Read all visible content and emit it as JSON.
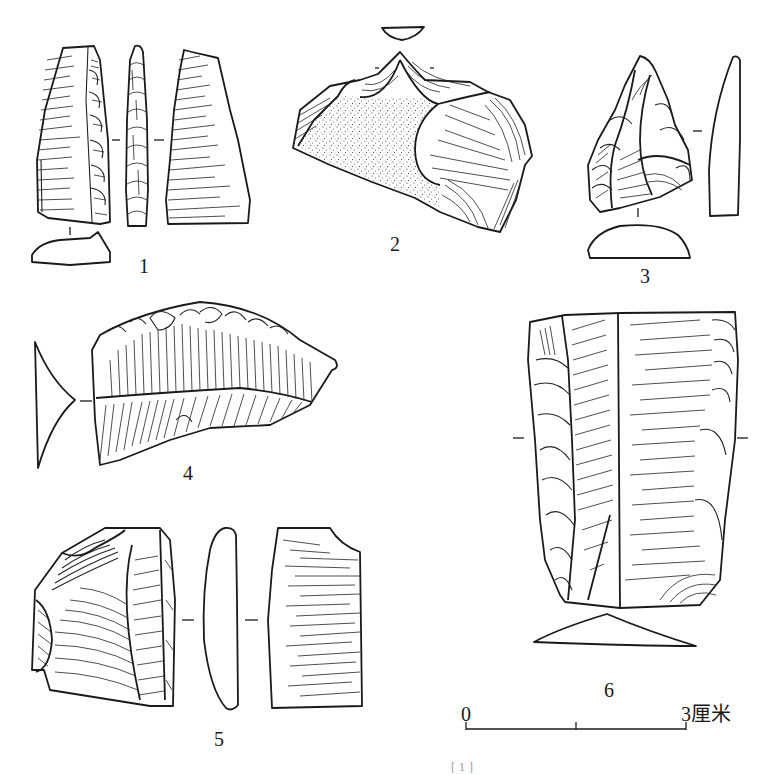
{
  "figure": {
    "type": "archaeological lithic artifact line drawing plate",
    "artifacts": [
      {
        "number": "1",
        "label": "1",
        "views": [
          "dorsal",
          "lateral",
          "ventral",
          "cross-section"
        ]
      },
      {
        "number": "2",
        "label": "2",
        "views": [
          "dorsal with cortex (stippled)",
          "cross-section"
        ]
      },
      {
        "number": "3",
        "label": "3",
        "views": [
          "dorsal",
          "lateral profile",
          "cross-section"
        ]
      },
      {
        "number": "4",
        "label": "4",
        "views": [
          "dorsal",
          "cross-section"
        ]
      },
      {
        "number": "5",
        "label": "5",
        "views": [
          "dorsal",
          "lateral profile",
          "ventral"
        ]
      },
      {
        "number": "6",
        "label": "6",
        "views": [
          "dorsal",
          "cross-section"
        ]
      }
    ],
    "scale_bar": {
      "start_label": "0",
      "end_label": "3厘米",
      "length_cm": 3,
      "divisions": 2
    },
    "footnote": "[1]",
    "colors": {
      "ink": "#1a1a1a",
      "paper": "#ffffff"
    }
  }
}
